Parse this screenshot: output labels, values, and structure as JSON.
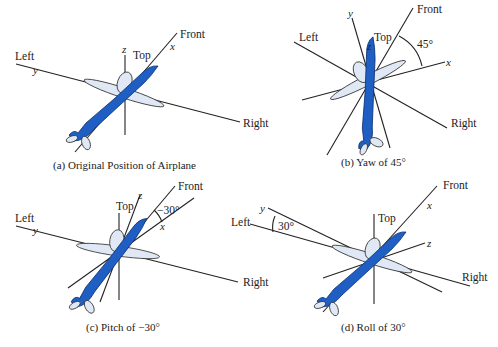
{
  "figure": {
    "panels": [
      {
        "id": "a",
        "caption": "(a) Original Position of Airplane",
        "labels": {
          "front": "Front",
          "left": "Left",
          "right": "Right",
          "top": "Top"
        },
        "axes": {
          "x": "x",
          "y": "y",
          "z": "z"
        }
      },
      {
        "id": "b",
        "caption": "(b) Yaw of 45°",
        "labels": {
          "front": "Front",
          "left": "Left",
          "right": "Right",
          "top": "Top"
        },
        "axes": {
          "x": "x",
          "y": "y",
          "z": "z"
        },
        "angle": "45°"
      },
      {
        "id": "c",
        "caption": "(c) Pitch of −30°",
        "labels": {
          "front": "Front",
          "left": "Left",
          "right": "Right",
          "top": "Top"
        },
        "axes": {
          "x": "x",
          "y": "y",
          "z": "z"
        },
        "angle": "−30°"
      },
      {
        "id": "d",
        "caption": "(d) Roll of 30°",
        "labels": {
          "front": "Front",
          "left": "Left",
          "right": "Right",
          "top": "Top"
        },
        "axes": {
          "x": "x",
          "y": "y",
          "z": "z"
        },
        "angle": "30°"
      }
    ],
    "colors": {
      "fuselage": "#1f5fc4",
      "wing": "#dfe8f4",
      "line": "#222222"
    }
  }
}
